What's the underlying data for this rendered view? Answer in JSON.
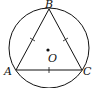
{
  "diagram": {
    "type": "inscribed-equilateral-triangle",
    "colors": {
      "stroke": "#111111",
      "background": "#ffffff"
    },
    "circle": {
      "center_label": "O",
      "cx": 49,
      "cy": 48,
      "r": 40
    },
    "points": {
      "A": {
        "label": "A",
        "x": 16,
        "y": 70
      },
      "B": {
        "label": "B",
        "x": 49,
        "y": 9
      },
      "C": {
        "label": "C",
        "x": 82,
        "y": 70
      },
      "O": {
        "label": "O",
        "x": 48,
        "y": 50
      }
    },
    "segments": [
      "AB",
      "BC",
      "CA"
    ],
    "tick_marks": [
      "AB",
      "BC",
      "CA"
    ]
  }
}
